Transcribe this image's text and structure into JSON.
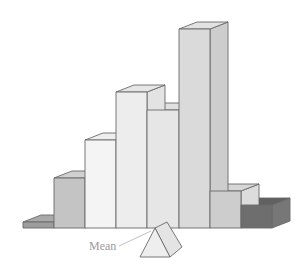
{
  "diagram": {
    "type": "3d-histogram-balance",
    "label": "Mean",
    "baseline_y": 228,
    "depth": {
      "dx": 18,
      "dy": -7
    },
    "bars": [
      {
        "x": 23,
        "w": 31,
        "top": 222,
        "front": "#9d9d9d",
        "side": "#8a8a8a",
        "topc": "#a9a9a9"
      },
      {
        "x": 54,
        "w": 31,
        "top": 178,
        "front": "#c4c4c4",
        "side": "#b6b6b6",
        "topc": "#d0d0d0"
      },
      {
        "x": 85,
        "w": 31,
        "top": 140,
        "front": "#f4f4f4",
        "side": "#e8e8e8",
        "topc": "#eeeeee"
      },
      {
        "x": 116,
        "w": 31,
        "top": 92,
        "front": "#ededed",
        "side": "#e3e3e3",
        "topc": "#e6e6e6"
      },
      {
        "x": 147,
        "w": 32,
        "top": 110,
        "front": "#e6e6e6",
        "side": "#dadada",
        "topc": "#e1e1e1"
      },
      {
        "x": 179,
        "w": 31,
        "top": 29,
        "front": "#dadada",
        "side": "#cdcdcd",
        "topc": "#e2e2e2"
      },
      {
        "x": 210,
        "w": 31,
        "top": 191,
        "front": "#cdcdcd",
        "side": "#dcdcdc",
        "topc": "#d6d6d6"
      },
      {
        "x": 241,
        "w": 31,
        "top": 205,
        "front": "#6e6e6e",
        "side": "#777777",
        "topc": "#606060"
      }
    ],
    "fulcrum": {
      "apex_x": 155,
      "apex_y": 228,
      "base_y": 257,
      "half_w": 15,
      "depth_dx": 12,
      "depth_dy": -10
    }
  }
}
